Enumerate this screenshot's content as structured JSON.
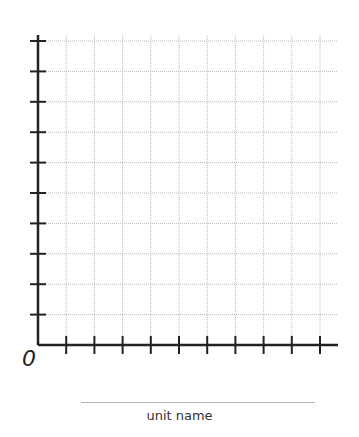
{
  "graph": {
    "origin_label": "0",
    "unit_label": "unit name",
    "x_ticks": 10,
    "y_ticks": 11,
    "colors": {
      "axis": "#222222",
      "grid": "#bbbbbb"
    }
  }
}
